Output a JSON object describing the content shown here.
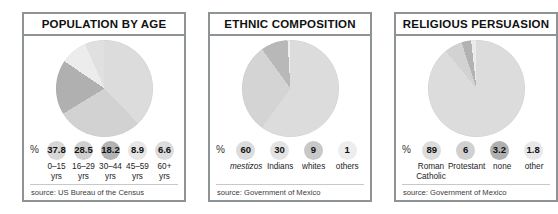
{
  "panels": [
    {
      "title": "POPULATION BY AGE",
      "pct_sign": "%",
      "source": "source: US Bureau of the Census",
      "legend": [
        {
          "value": "37.8",
          "label_line1": "0–15",
          "label_line2": "yrs",
          "swatch": "#d7d7d7",
          "italic": false
        },
        {
          "value": "28.5",
          "label_line1": "16–29",
          "label_line2": "yrs",
          "swatch": "#cfcfcf",
          "italic": false
        },
        {
          "value": "18.2",
          "label_line1": "30–44",
          "label_line2": "yrs",
          "swatch": "#b3b3b3",
          "italic": false
        },
        {
          "value": "8.9",
          "label_line1": "45–59",
          "label_line2": "yrs",
          "swatch": "#e6e6e6",
          "italic": false
        },
        {
          "value": "6.6",
          "label_line1": "60+",
          "label_line2": "yrs",
          "swatch": "#dcdcdc",
          "italic": false
        }
      ],
      "chart_data": {
        "type": "pie",
        "title": "POPULATION BY AGE",
        "categories": [
          "0–15 yrs",
          "16–29 yrs",
          "30–44 yrs",
          "45–59 yrs",
          "60+ yrs"
        ],
        "values": [
          37.8,
          28.5,
          18.2,
          8.9,
          6.6
        ],
        "unit": "%",
        "colors": [
          "#dcdcdc",
          "#d2d2d2",
          "#b0b0b0",
          "#ececec",
          "#e0e0e0"
        ],
        "start_angle_deg": 0,
        "direction": "clockwise",
        "legend": "below",
        "source": "source: US Bureau of the Census"
      }
    },
    {
      "title": "ETHNIC COMPOSITION",
      "pct_sign": "%",
      "source": "source: Government of Mexico",
      "legend": [
        {
          "value": "60",
          "label_line1": "mestizos",
          "label_line2": "",
          "swatch": "#dcdcdc",
          "italic": true
        },
        {
          "value": "30",
          "label_line1": "Indians",
          "label_line2": "",
          "swatch": "#e3e3e3",
          "italic": false
        },
        {
          "value": "9",
          "label_line1": "whites",
          "label_line2": "",
          "swatch": "#c8c8c8",
          "italic": false
        },
        {
          "value": "1",
          "label_line1": "others",
          "label_line2": "",
          "swatch": "#ededed",
          "italic": false
        }
      ],
      "chart_data": {
        "type": "pie",
        "title": "ETHNIC COMPOSITION",
        "categories": [
          "mestizos",
          "Indians",
          "whites",
          "others"
        ],
        "values": [
          60,
          30,
          9,
          1
        ],
        "unit": "%",
        "colors": [
          "#dcdcdc",
          "#d4d4d4",
          "#b8b8b8",
          "#efefef"
        ],
        "start_angle_deg": 0,
        "direction": "clockwise",
        "legend": "below",
        "source": "source: Government of Mexico"
      }
    },
    {
      "title": "RELIGIOUS PERSUASION",
      "pct_sign": "%",
      "source": "source: Government of Mexico",
      "legend": [
        {
          "value": "89",
          "label_line1": "Roman",
          "label_line2": "Catholic",
          "swatch": "#dcdcdc",
          "italic": false
        },
        {
          "value": "6",
          "label_line1": "Protestant",
          "label_line2": "",
          "swatch": "#d0d0d0",
          "italic": false
        },
        {
          "value": "3.2",
          "label_line1": "none",
          "label_line2": "",
          "swatch": "#b0b0b0",
          "italic": false
        },
        {
          "value": "1.8",
          "label_line1": "other",
          "label_line2": "",
          "swatch": "#e8e8e8",
          "italic": false
        }
      ],
      "chart_data": {
        "type": "pie",
        "title": "RELIGIOUS PERSUASION",
        "categories": [
          "Roman Catholic",
          "Protestant",
          "none",
          "other"
        ],
        "values": [
          89,
          6,
          3.2,
          1.8
        ],
        "unit": "%",
        "colors": [
          "#dcdcdc",
          "#d2d2d2",
          "#b2b2b2",
          "#ebebeb"
        ],
        "start_angle_deg": 0,
        "direction": "clockwise",
        "legend": "below",
        "source": "source: Government of Mexico"
      }
    }
  ]
}
